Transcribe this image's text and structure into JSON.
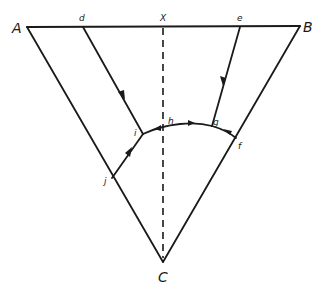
{
  "diagram": {
    "stroke_color": "#1a1a1a",
    "background": "#ffffff",
    "vertices": {
      "A": {
        "label": "A"
      },
      "B": {
        "label": "B"
      },
      "C": {
        "label": "C"
      },
      "X": {
        "label": "X"
      }
    },
    "points": {
      "d": {
        "label": "d"
      },
      "e": {
        "label": "e"
      },
      "f": {
        "label": "f"
      },
      "g": {
        "label": "g"
      },
      "h": {
        "label": "h"
      },
      "i": {
        "label": "i"
      },
      "j": {
        "label": "j"
      }
    },
    "edges": [
      {
        "from": "A",
        "to": "B",
        "style": "solid"
      },
      {
        "from": "A",
        "to": "C",
        "style": "solid"
      },
      {
        "from": "B",
        "to": "C",
        "style": "solid"
      },
      {
        "from": "X",
        "to": "C",
        "style": "dashed"
      },
      {
        "from": "d",
        "to": "i",
        "style": "solid",
        "arrow": "toward i"
      },
      {
        "from": "e",
        "to": "g",
        "style": "solid",
        "arrow": "toward g"
      },
      {
        "from": "j",
        "to": "i",
        "style": "solid",
        "arrow": "toward i"
      },
      {
        "from": "f",
        "to": "g",
        "style": "solid",
        "arrow": "toward g"
      },
      {
        "from": "i",
        "to": "g",
        "style": "solid",
        "via": "h",
        "arrows": [
          "toward i near axis",
          "toward g"
        ]
      }
    ]
  }
}
